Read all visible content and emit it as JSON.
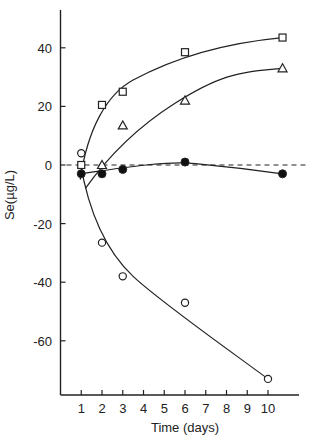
{
  "chart_data": {
    "type": "scatter",
    "title": "",
    "xlabel": "Time (days)",
    "ylabel": "Se(µg/L)",
    "xlim": [
      0,
      11.5
    ],
    "ylim": [
      -75,
      53
    ],
    "x_ticks": [
      1,
      2,
      3,
      4,
      5,
      6,
      7,
      8,
      9,
      10
    ],
    "y_ticks": [
      40,
      20,
      0,
      -20,
      -40,
      -60
    ],
    "grid": false,
    "legend": null,
    "reference_line": {
      "y": 0,
      "style": "dashed"
    },
    "series": [
      {
        "name": "open-squares",
        "marker": "square-open",
        "points": [
          [
            1,
            0
          ],
          [
            2,
            20.5
          ],
          [
            3,
            25
          ],
          [
            6,
            38.5
          ],
          [
            10.7,
            43.5
          ]
        ],
        "fit_curve": true
      },
      {
        "name": "open-triangles",
        "marker": "triangle-open",
        "points": [
          [
            2,
            0
          ],
          [
            3,
            13.5
          ],
          [
            6,
            22
          ],
          [
            10.7,
            33
          ]
        ],
        "fit_curve": true
      },
      {
        "name": "filled-circles",
        "marker": "circle-filled",
        "points": [
          [
            1,
            -3
          ],
          [
            2,
            -3
          ],
          [
            3,
            -1.5
          ],
          [
            6,
            1
          ],
          [
            10.7,
            -3
          ]
        ],
        "fit_curve": true
      },
      {
        "name": "open-circles",
        "marker": "circle-open",
        "points": [
          [
            1,
            4
          ],
          [
            2,
            -26.5
          ],
          [
            3,
            -38
          ],
          [
            6,
            -47
          ],
          [
            10,
            -73
          ]
        ],
        "fit_curve": true
      }
    ]
  }
}
